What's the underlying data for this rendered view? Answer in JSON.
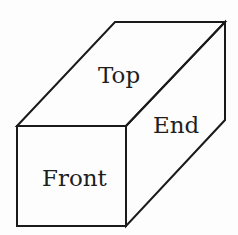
{
  "diagram": {
    "title": "",
    "type": "isometric-box",
    "faces": [
      {
        "id": "top",
        "label": "Top"
      },
      {
        "id": "end",
        "label": "End"
      },
      {
        "id": "front",
        "label": "Front"
      }
    ],
    "colors": {
      "background": "#fdfdfd",
      "stroke": "#1a1a1a",
      "text": "#1e1e1e"
    }
  }
}
